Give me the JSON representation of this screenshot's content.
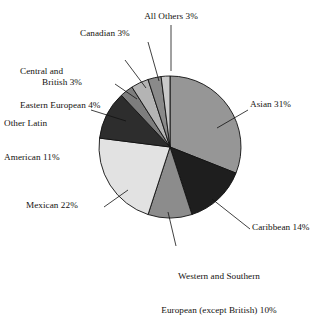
{
  "chart_data": {
    "type": "pie",
    "title": "",
    "subtitle": "",
    "xlabel": "",
    "ylabel": "",
    "grid": false,
    "legend_position": "none",
    "label_style": "callout labels with leader lines",
    "total_percent": 101,
    "start_angle_deg": 0,
    "direction": "clockwise",
    "categories": [
      "Asian",
      "Caribbean",
      "Western and Southern European (except British)",
      "Mexican",
      "Other Latin American",
      "British",
      "Central and Eastern European",
      "Canadian",
      "All Others"
    ],
    "values": [
      31,
      14,
      10,
      22,
      11,
      3,
      4,
      3,
      3
    ],
    "slices": [
      {
        "name": "Asian",
        "value": 31,
        "label": "Asian 31%",
        "color": "#969696",
        "start_deg": 0,
        "end_deg": 111.6,
        "label_align": "left",
        "leader": {
          "x1": 248,
          "y1": 110,
          "x2": 217,
          "y2": 128
        }
      },
      {
        "name": "Caribbean",
        "value": 14,
        "label": "Caribbean 14%",
        "color": "#1e1e1e",
        "start_deg": 111.6,
        "end_deg": 162.0,
        "label_align": "left",
        "leader": {
          "x1": 250,
          "y1": 229,
          "x2": 212,
          "y2": 199
        }
      },
      {
        "name": "Western and Southern European (except British)",
        "value": 10,
        "label": "Western and Southern\nEuropean (except British) 10%",
        "label_line_1": "Western and Southern",
        "label_line_2": "European (except British) 10%",
        "color": "#8c8c8c",
        "start_deg": 162.0,
        "end_deg": 198.0,
        "label_align": "center",
        "leader": {
          "x1": 176,
          "y1": 246,
          "x2": 168,
          "y2": 212
        }
      },
      {
        "name": "Mexican",
        "value": 22,
        "label": "Mexican 22%",
        "color": "#e2e2e2",
        "start_deg": 198.0,
        "end_deg": 277.2,
        "label_align": "right",
        "leader": {
          "x1": 104,
          "y1": 207,
          "x2": 128,
          "y2": 190
        }
      },
      {
        "name": "Other Latin American",
        "value": 11,
        "label": "Other Latin\nAmerican 11%",
        "label_line_1": "Other Latin",
        "label_line_2": "American 11%",
        "color": "#2d2d2d",
        "start_deg": 277.2,
        "end_deg": 316.8,
        "label_align": "right",
        "leader": {
          "x1": 91,
          "y1": 110,
          "x2": 126,
          "y2": 121
        }
      },
      {
        "name": "British",
        "value": 3,
        "label": "British 3%",
        "color": "#7d7d7d",
        "start_deg": 316.8,
        "end_deg": 327.6,
        "label_align": "right",
        "leader": {
          "x1": 115,
          "y1": 84,
          "x2": 137,
          "y2": 99
        }
      },
      {
        "name": "Central and Eastern European",
        "value": 4,
        "label": "Central and\nEastern European 4%",
        "label_line_1": "Central and",
        "label_line_2": "Eastern European 4%",
        "color": "#b4b4b4",
        "start_deg": 327.6,
        "end_deg": 342.0,
        "label_align": "right",
        "leader": {
          "x1": 125,
          "y1": 60,
          "x2": 146,
          "y2": 88
        }
      },
      {
        "name": "Canadian",
        "value": 3,
        "label": "Canadian 3%",
        "color": "#8a8a8a",
        "start_deg": 342.0,
        "end_deg": 352.8,
        "label_align": "right",
        "leader": {
          "x1": 148,
          "y1": 42,
          "x2": 159,
          "y2": 81
        }
      },
      {
        "name": "All Others",
        "value": 3,
        "label": "All Others 3%",
        "color": "#c9c9c9",
        "start_deg": 352.8,
        "end_deg": 360.0,
        "label_align": "center",
        "leader": {
          "x1": 171,
          "y1": 25,
          "x2": 171,
          "y2": 71
        }
      }
    ],
    "geometry": {
      "center_x": 170,
      "center_y": 147,
      "radius": 71
    },
    "colors": {
      "outline": "#111111",
      "background": "#ffffff",
      "text": "#14120f"
    }
  }
}
